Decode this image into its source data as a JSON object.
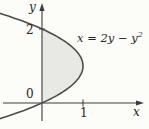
{
  "figure": {
    "background": "#fcfcf9",
    "axis_color": "#3b3b3b",
    "curve_color": "#4c4c4c",
    "shade_color": "#e8e8e4",
    "text_color": "#262626"
  },
  "labels": {
    "y_axis": "y",
    "x_axis": "x",
    "origin": "0",
    "y_tick_2": "2",
    "x_tick_1": "1",
    "equation_base": "x = 2y − y",
    "equation_sup": "2"
  },
  "chart_data": {
    "type": "line",
    "title": "",
    "equation": "x = 2y - y^2",
    "curve": {
      "a": 2,
      "b": -1,
      "param": "y",
      "y_range": [
        -0.45,
        2.45
      ]
    },
    "key_points": [
      {
        "x": 0,
        "y": 0
      },
      {
        "x": 1,
        "y": 1
      },
      {
        "x": 0,
        "y": 2
      }
    ],
    "x_ticks": [
      1
    ],
    "y_ticks": [
      0,
      2
    ],
    "xlabel": "x",
    "ylabel": "y",
    "xlim": [
      -1.0,
      2.45
    ],
    "ylim": [
      -0.7,
      2.65
    ],
    "grid": false,
    "legend": null,
    "shaded_region": {
      "description": "Region enclosed between the y-axis and the parabola x = 2y - y^2 from y = 0 to y = 2",
      "y_bounds": [
        0,
        2
      ]
    }
  }
}
